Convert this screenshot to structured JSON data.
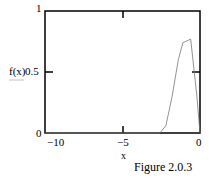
{
  "chart_data": {
    "type": "line",
    "title": "",
    "xlabel": "x",
    "ylabel": "f(x)",
    "xlim": [
      -10,
      0
    ],
    "ylim": [
      0,
      1
    ],
    "x_ticks": [
      "-10",
      "-5",
      "0"
    ],
    "y_ticks": [
      "0",
      "0.5",
      "1"
    ],
    "grid": false,
    "series": [
      {
        "name": "f(x)",
        "x": [
          -10,
          -3,
          -2.6,
          -2.2,
          -1.8,
          -1.4,
          -1.1,
          -0.6,
          -0.2,
          0
        ],
        "values": [
          0,
          0,
          0.0,
          0.06,
          0.3,
          0.6,
          0.74,
          0.77,
          0.3,
          0
        ]
      }
    ],
    "caption": "Figure 2.0.3"
  },
  "labels": {
    "y_top": "1",
    "y_mid": "0.5",
    "y_bottom": "0",
    "y_axis": "f(x)",
    "x_left": "−10",
    "x_mid": "−5",
    "x_right": "0",
    "x_axis": "x",
    "caption": "Figure 2.0.3"
  }
}
